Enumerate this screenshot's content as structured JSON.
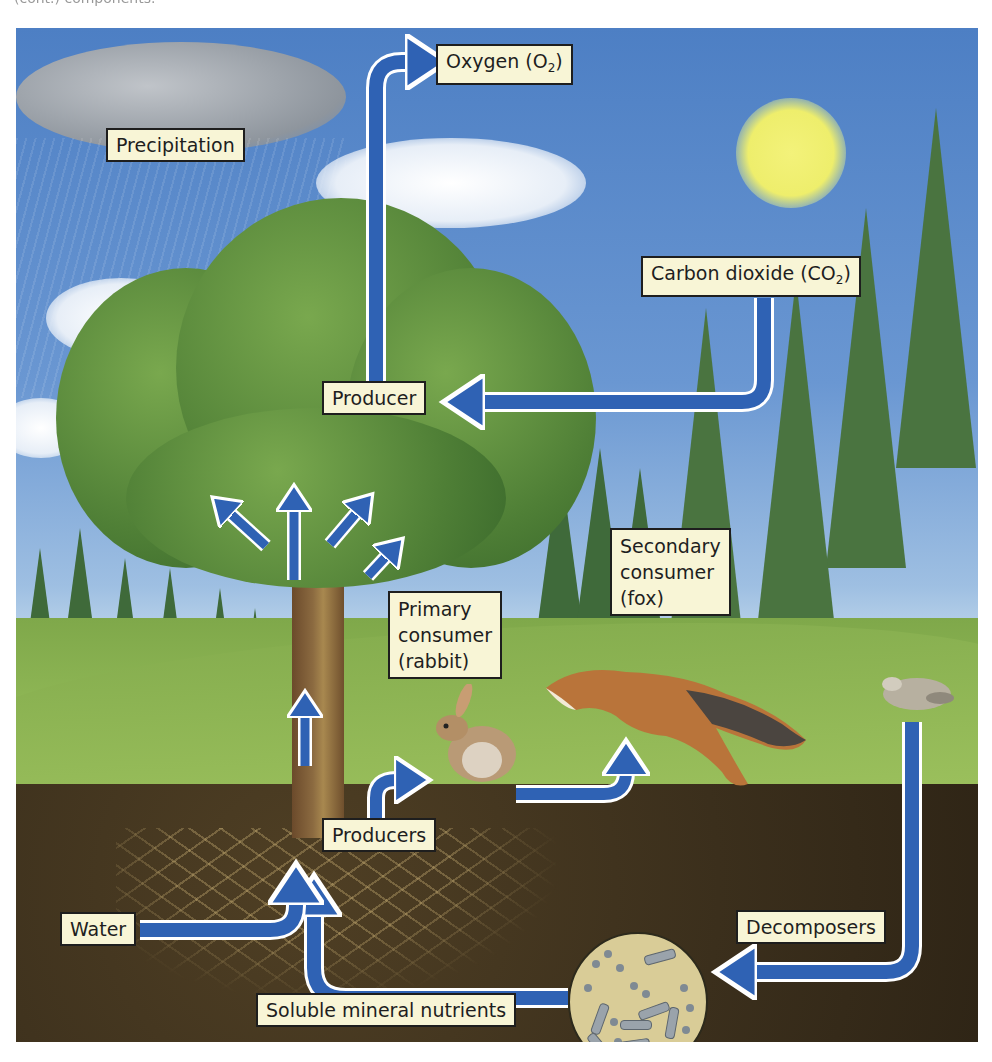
{
  "caption_fragment": "(cont.) components.",
  "diagram": {
    "type": "ecosystem nutrient and energy cycle",
    "colors": {
      "arrow_fill": "#2f62b4",
      "arrow_outline": "#ffffff",
      "label_fill": "#f8f5d6",
      "label_border": "#1e1e1e",
      "sky": "#5a8bcd",
      "soil": "#3b2f1c",
      "sun": "#eeee6c"
    },
    "labels": {
      "precipitation": "Precipitation",
      "oxygen_main": "Oxygen (O",
      "oxygen_sub": "2",
      "oxygen_close": ")",
      "co2_main": "Carbon dioxide (CO",
      "co2_sub": "2",
      "co2_close": ")",
      "producer": "Producer",
      "primary_consumer": "Primary\nconsumer\n(rabbit)",
      "secondary_consumer": "Secondary\nconsumer\n(fox)",
      "producers": "Producers",
      "water": "Water",
      "decomposers": "Decomposers",
      "soluble_nutrients": "Soluble mineral nutrients"
    },
    "icons": {
      "cloud_rain": "rain-cloud-icon",
      "sun": "sun-icon",
      "tree": "tree-icon",
      "rabbit": "rabbit-icon",
      "fox": "fox-icon",
      "dead_rabbit": "carcass-icon",
      "microbes": "bacteria-icon"
    },
    "flows": [
      {
        "from": "Producer",
        "to": "Oxygen (O2)"
      },
      {
        "from": "Carbon dioxide (CO2)",
        "to": "Producer"
      },
      {
        "from": "Producers",
        "to": "Primary consumer (rabbit)"
      },
      {
        "from": "Primary consumer (rabbit)",
        "to": "Secondary consumer (fox)"
      },
      {
        "from": "Decomposers",
        "to": "Soluble mineral nutrients"
      },
      {
        "from": "Soluble mineral nutrients",
        "to": "Producers"
      },
      {
        "from": "Water",
        "to": "Producers"
      },
      {
        "from": "Trunk",
        "to": "Canopy"
      }
    ]
  }
}
